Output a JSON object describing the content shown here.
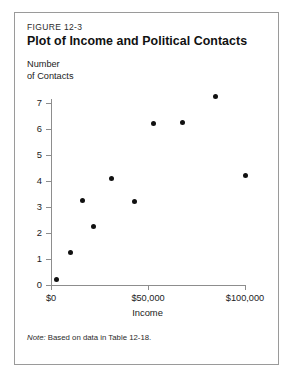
{
  "figure": {
    "number": "FIGURE 12-3",
    "title": "Plot of Income and Political Contacts",
    "note_lead": "Note:",
    "note_text": "Based on data in Table 12-18."
  },
  "chart_data": {
    "type": "scatter",
    "title": "Plot of Income and Political Contacts",
    "xlabel": "Income",
    "ylabel": "Number of Contacts",
    "ylabel_lines": [
      "Number",
      "of Contacts"
    ],
    "xlim": [
      0,
      105000
    ],
    "ylim": [
      0,
      7.4
    ],
    "grid": false,
    "legend": null,
    "xticks": [
      0,
      50000,
      100000
    ],
    "xtick_labels": [
      "$0",
      "$50,000",
      "$100,000"
    ],
    "yticks": [
      0,
      1,
      2,
      3,
      4,
      5,
      6,
      7
    ],
    "ytick_labels": [
      "0",
      "1",
      "2",
      "3",
      "4",
      "5",
      "6",
      "7"
    ],
    "marker": {
      "shape": "circle",
      "color": "#111111",
      "size": 5
    },
    "points": [
      {
        "x": 3000,
        "y": 0.2
      },
      {
        "x": 10000,
        "y": 1.25
      },
      {
        "x": 16000,
        "y": 3.25
      },
      {
        "x": 22000,
        "y": 2.25
      },
      {
        "x": 31000,
        "y": 4.1
      },
      {
        "x": 43000,
        "y": 3.2
      },
      {
        "x": 53000,
        "y": 6.2
      },
      {
        "x": 68000,
        "y": 6.25
      },
      {
        "x": 85000,
        "y": 7.25
      },
      {
        "x": 100000,
        "y": 4.2
      }
    ]
  },
  "axis_geometry": {
    "origin_x_px": 36,
    "origin_y_px": 272,
    "x_px_per_unit": 0.00194,
    "y_px_per_unit": 26.0
  }
}
